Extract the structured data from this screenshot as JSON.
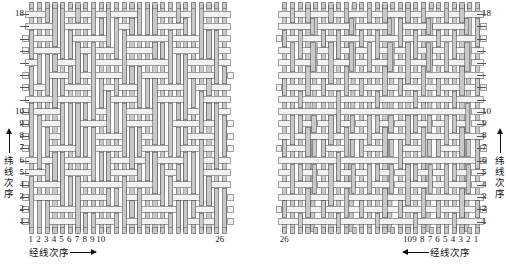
{
  "figure": {
    "title_visible": false,
    "panel_count": 2,
    "colors": {
      "warp_fill": "#c9c9c9",
      "weft_fill": "#f2f2f2",
      "outline": "#555555",
      "text": "#222222",
      "background": "#ffffff"
    }
  },
  "chart_data": {
    "type": "table",
    "title": "",
    "xlabel": "经线次序",
    "ylabel": "纬线次序",
    "warp_count": 26,
    "weft_count": 18,
    "x_ticks_left": [
      "1",
      "2",
      "3",
      "4",
      "5",
      "6",
      "7",
      "8",
      "9",
      "10",
      "26"
    ],
    "x_ticks_right": [
      "26",
      "10",
      "9",
      "8",
      "7",
      "6",
      "5",
      "4",
      "3",
      "2",
      "1"
    ],
    "y_ticks": [
      "18",
      "10",
      "9",
      "8",
      "7",
      "6",
      "5",
      "4",
      "3",
      "2",
      "1"
    ]
  },
  "panels": [
    {
      "id": "left",
      "name": "panel-left",
      "axis_side": "left",
      "warp_direction": "right",
      "y_labels": [
        {
          "value": "18",
          "index": 18
        },
        {
          "value": "10",
          "index": 10
        },
        {
          "value": "9",
          "index": 9
        },
        {
          "value": "8",
          "index": 8
        },
        {
          "value": "7",
          "index": 7
        },
        {
          "value": "6",
          "index": 6
        },
        {
          "value": "5",
          "index": 5
        },
        {
          "value": "4",
          "index": 4
        },
        {
          "value": "3",
          "index": 3
        },
        {
          "value": "2",
          "index": 2
        },
        {
          "value": "1",
          "index": 1
        }
      ],
      "x_labels_run": [
        "1",
        "2",
        "3",
        "4",
        "5",
        "6",
        "7",
        "8",
        "9",
        "10"
      ],
      "x_label_end": "26",
      "x_axis_title": "经线次序",
      "x_axis_arrow": "right-arrow",
      "y_axis_title": "纬线次序",
      "y_axis_arrow": "up-arrow"
    },
    {
      "id": "right",
      "name": "panel-right",
      "axis_side": "right",
      "warp_direction": "left",
      "y_labels": [
        {
          "value": "18",
          "index": 18
        },
        {
          "value": "10",
          "index": 10
        },
        {
          "value": "9",
          "index": 9
        },
        {
          "value": "8",
          "index": 8
        },
        {
          "value": "7",
          "index": 7
        },
        {
          "value": "6",
          "index": 6
        },
        {
          "value": "5",
          "index": 5
        },
        {
          "value": "4",
          "index": 4
        },
        {
          "value": "3",
          "index": 3
        },
        {
          "value": "2",
          "index": 2
        },
        {
          "value": "1",
          "index": 1
        }
      ],
      "x_labels_run": [
        "10",
        "9",
        "8",
        "7",
        "6",
        "5",
        "4",
        "3",
        "2",
        "1"
      ],
      "x_label_end": "26",
      "x_axis_title": "经线次序",
      "x_axis_arrow": "left-arrow",
      "y_axis_title": "纬线次序",
      "y_axis_arrow": "up-arrow"
    }
  ],
  "labels": {
    "warp_order": "经线次序",
    "weft_order": "纬线次序",
    "weft_chars": [
      "纬",
      "线",
      "次",
      "序"
    ]
  }
}
